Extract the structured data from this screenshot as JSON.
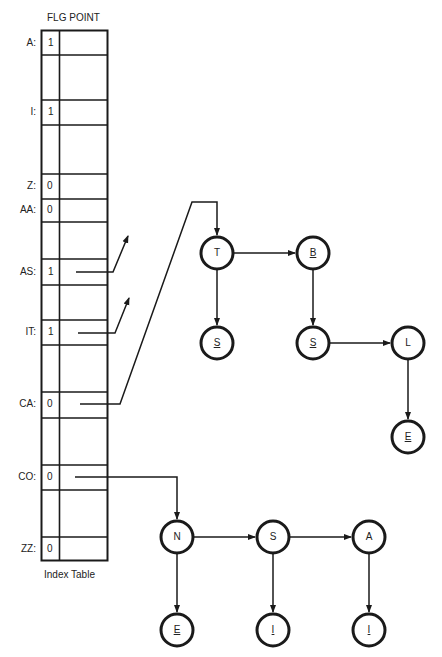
{
  "table": {
    "header": "FLG POINT",
    "caption": "Index Table",
    "rows": [
      {
        "key": "A:",
        "flg": "1",
        "top": 30,
        "bottom": 55
      },
      {
        "key": "",
        "flg": "",
        "top": 55,
        "bottom": 100
      },
      {
        "key": "I:",
        "flg": "1",
        "top": 100,
        "bottom": 125
      },
      {
        "key": "",
        "flg": "",
        "top": 125,
        "bottom": 174
      },
      {
        "key": "Z:",
        "flg": "0",
        "top": 174,
        "bottom": 199
      },
      {
        "key": "AA:",
        "flg": "0",
        "top": 199,
        "bottom": 222
      },
      {
        "key": "",
        "flg": "",
        "top": 222,
        "bottom": 259
      },
      {
        "key": "AS:",
        "flg": "1",
        "top": 259,
        "bottom": 285
      },
      {
        "key": "",
        "flg": "",
        "top": 285,
        "bottom": 320
      },
      {
        "key": "IT:",
        "flg": "1",
        "top": 320,
        "bottom": 345
      },
      {
        "key": "",
        "flg": "",
        "top": 345,
        "bottom": 392
      },
      {
        "key": "CA:",
        "flg": "0",
        "top": 392,
        "bottom": 418
      },
      {
        "key": "",
        "flg": "",
        "top": 418,
        "bottom": 465
      },
      {
        "key": "CO:",
        "flg": "0",
        "top": 465,
        "bottom": 490
      },
      {
        "key": "",
        "flg": "",
        "top": 490,
        "bottom": 537
      },
      {
        "key": "ZZ:",
        "flg": "0",
        "top": 537,
        "bottom": 561
      }
    ]
  },
  "labels": {
    "header": "FLG POINT",
    "caption": "Index Table",
    "A": "A:",
    "A_flg": "1",
    "I": "I:",
    "I_flg": "1",
    "Z": "Z:",
    "Z_flg": "0",
    "AA": "AA:",
    "AA_flg": "0",
    "AS": "AS:",
    "AS_flg": "1",
    "IT": "IT:",
    "IT_flg": "1",
    "CA": "CA:",
    "CA_flg": "0",
    "CO": "CO:",
    "CO_flg": "0",
    "ZZ": "ZZ:",
    "ZZ_flg": "0"
  },
  "trees": {
    "ca_tree": {
      "nodes": {
        "T": {
          "label": "T",
          "underlined": false
        },
        "B": {
          "label": "B",
          "underlined": true
        },
        "S1": {
          "label": "S",
          "underlined": true
        },
        "S2": {
          "label": "S",
          "underlined": true
        },
        "L": {
          "label": "L",
          "underlined": false
        },
        "E": {
          "label": "E",
          "underlined": true
        }
      }
    },
    "co_tree": {
      "nodes": {
        "N": {
          "label": "N",
          "underlined": false
        },
        "S": {
          "label": "S",
          "underlined": false
        },
        "A": {
          "label": "A",
          "underlined": false
        },
        "E": {
          "label": "E",
          "underlined": true
        },
        "I1": {
          "label": "I",
          "underlined": true
        },
        "I2": {
          "label": "I",
          "underlined": true
        }
      }
    }
  },
  "colors": {
    "ink": "#1a1a1a",
    "background": "#ffffff"
  }
}
